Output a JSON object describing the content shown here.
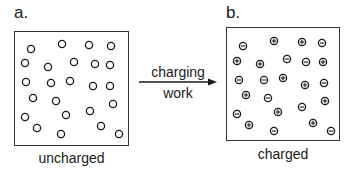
{
  "panel_a": {
    "label": "a.",
    "caption": "uncharged",
    "particles": [
      {
        "x": 31,
        "y": 49
      },
      {
        "x": 62,
        "y": 44
      },
      {
        "x": 89,
        "y": 45
      },
      {
        "x": 111,
        "y": 46
      },
      {
        "x": 25,
        "y": 63
      },
      {
        "x": 48,
        "y": 67
      },
      {
        "x": 74,
        "y": 62
      },
      {
        "x": 95,
        "y": 64
      },
      {
        "x": 110,
        "y": 65
      },
      {
        "x": 26,
        "y": 82
      },
      {
        "x": 51,
        "y": 83
      },
      {
        "x": 70,
        "y": 81
      },
      {
        "x": 93,
        "y": 86
      },
      {
        "x": 110,
        "y": 86
      },
      {
        "x": 33,
        "y": 98
      },
      {
        "x": 56,
        "y": 101
      },
      {
        "x": 113,
        "y": 104
      },
      {
        "x": 25,
        "y": 117
      },
      {
        "x": 66,
        "y": 115
      },
      {
        "x": 90,
        "y": 111
      },
      {
        "x": 37,
        "y": 128
      },
      {
        "x": 61,
        "y": 134
      },
      {
        "x": 101,
        "y": 126
      },
      {
        "x": 119,
        "y": 134
      }
    ]
  },
  "panel_b": {
    "label": "b.",
    "caption": "charged",
    "particles": [
      {
        "x": 243,
        "y": 46,
        "charge": "-"
      },
      {
        "x": 274,
        "y": 41,
        "charge": "+"
      },
      {
        "x": 302,
        "y": 42,
        "charge": "+"
      },
      {
        "x": 322,
        "y": 43,
        "charge": "-"
      },
      {
        "x": 237,
        "y": 61,
        "charge": "+"
      },
      {
        "x": 260,
        "y": 64,
        "charge": "+"
      },
      {
        "x": 287,
        "y": 59,
        "charge": "-"
      },
      {
        "x": 306,
        "y": 62,
        "charge": "-"
      },
      {
        "x": 323,
        "y": 62,
        "charge": "+"
      },
      {
        "x": 239,
        "y": 80,
        "charge": "-"
      },
      {
        "x": 264,
        "y": 80,
        "charge": "-"
      },
      {
        "x": 283,
        "y": 78,
        "charge": "+"
      },
      {
        "x": 305,
        "y": 85,
        "charge": "+"
      },
      {
        "x": 324,
        "y": 83,
        "charge": "-"
      },
      {
        "x": 246,
        "y": 95,
        "charge": "+"
      },
      {
        "x": 268,
        "y": 98,
        "charge": "-"
      },
      {
        "x": 325,
        "y": 101,
        "charge": "+"
      },
      {
        "x": 237,
        "y": 114,
        "charge": "-"
      },
      {
        "x": 278,
        "y": 112,
        "charge": "+"
      },
      {
        "x": 302,
        "y": 107,
        "charge": "-"
      },
      {
        "x": 249,
        "y": 125,
        "charge": "+"
      },
      {
        "x": 274,
        "y": 131,
        "charge": "-"
      },
      {
        "x": 313,
        "y": 123,
        "charge": "+"
      },
      {
        "x": 331,
        "y": 131,
        "charge": "-"
      }
    ]
  },
  "arrow": {
    "label_above": "charging",
    "label_below": "work"
  },
  "colors": {
    "ink": "#1a1a1a",
    "box_border": "#333333",
    "background": "#ffffff"
  }
}
